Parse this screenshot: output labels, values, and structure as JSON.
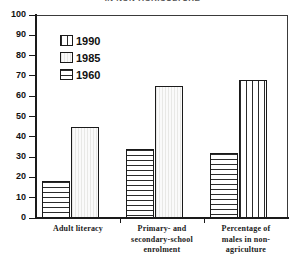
{
  "chart_data": {
    "type": "bar",
    "title": "IN NON-AGRICULTURE",
    "xlabel": "",
    "ylabel": "",
    "ylim": [
      0,
      100
    ],
    "yticks": [
      0,
      10,
      20,
      30,
      40,
      50,
      60,
      70,
      80,
      90,
      100
    ],
    "grid": false,
    "legend_position": "top-left",
    "categories": [
      "Adult literacy",
      "Primary- and secondary-school enrolment",
      "Percentage of males in non-agriculture"
    ],
    "category_lines": [
      [
        "Adult literacy"
      ],
      [
        "Primary- and",
        "secondary-school",
        "enrolment"
      ],
      [
        "Percentage of",
        "males in non-",
        "agriculture"
      ]
    ],
    "series": [
      {
        "name": "1990",
        "pattern": "vertical-stripes",
        "values": [
          null,
          null,
          68
        ]
      },
      {
        "name": "1985",
        "pattern": "light-solid",
        "values": [
          45,
          65,
          null
        ]
      },
      {
        "name": "1960",
        "pattern": "horizontal-stripes",
        "values": [
          18,
          34,
          32
        ]
      }
    ]
  },
  "legend": {
    "items": [
      {
        "label": "1990",
        "pattern": "vertical-stripes"
      },
      {
        "label": "1985",
        "pattern": "light-solid"
      },
      {
        "label": "1960",
        "pattern": "horizontal-stripes"
      }
    ]
  },
  "colors": {
    "axis": "#1a1a1a",
    "frame": "#3a3a3a",
    "hatch": "#2b2b2b",
    "light_fill": "#f4f4f2",
    "background": "#ffffff"
  }
}
